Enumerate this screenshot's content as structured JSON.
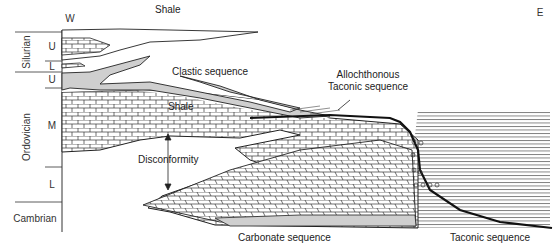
{
  "orientation": {
    "west": "W",
    "east": "E"
  },
  "column": {
    "periods": [
      {
        "name": "Silurian",
        "subdivisions": [
          "U",
          "L"
        ]
      },
      {
        "name": "Ordovician",
        "subdivisions": [
          "U",
          "M",
          "L"
        ]
      },
      {
        "name": "Cambrian",
        "subdivisions": []
      }
    ]
  },
  "labels": {
    "shale_upper": "Shale",
    "clastic": "Clastic sequence",
    "shale_middle": "Shale",
    "allochthonous_1": "Allochthonous",
    "allochthonous_2": "Taconic sequence",
    "disconformity": "Disconformity",
    "carbonate": "Carbonate sequence",
    "taconic": "Taconic sequence"
  },
  "colors": {
    "clastic_fill": "#cfcfcf",
    "ink": "#222222"
  }
}
